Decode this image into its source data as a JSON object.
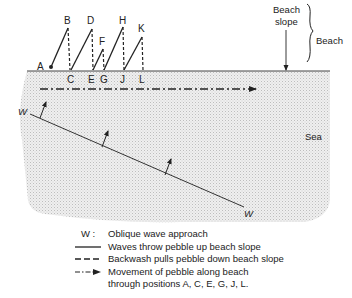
{
  "points": {
    "A": "A",
    "B": "B",
    "C": "C",
    "D": "D",
    "E": "E",
    "F": "F",
    "G": "G",
    "H": "H",
    "J": "J",
    "K": "K",
    "L": "L"
  },
  "labels": {
    "beach_slope_line1": "Beach",
    "beach_slope_line2": "slope",
    "beach": "Beach",
    "sea": "Sea",
    "wave_start": "W",
    "wave_end": "W"
  },
  "legend": {
    "items": [
      {
        "key": "W :",
        "key_type": "letter",
        "text": "Oblique wave approach"
      },
      {
        "key_type": "solid-line",
        "text": "Waves throw pebble up beach slope"
      },
      {
        "key_type": "dashed-line",
        "text": "Backwash pulls pebble down beach slope"
      },
      {
        "key_type": "dash-dot-arrow",
        "text": "Movement of pebble along beach"
      },
      {
        "key_type": "none",
        "text": "through positions A, C, E, G, J, L."
      }
    ]
  },
  "colors": {
    "ink": "#222222",
    "sea_fill": "#e9e9e9"
  }
}
